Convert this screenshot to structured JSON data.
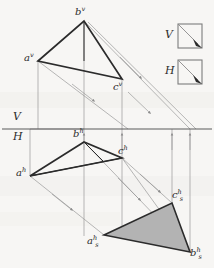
{
  "drawing": {
    "title": "Rabatment of a triangle in two-plane descriptive geometry projection",
    "type": "descriptive-geometry-projection",
    "background_color": "#f7f6f4",
    "ink_color": "#2b2b2b",
    "construction_color": "#9a9a9a",
    "fill_color": "#b3b3b3",
    "canvas": {
      "width": 214,
      "height": 268
    }
  },
  "ground_line": {
    "y": 129,
    "x_start": 2,
    "x_end": 212,
    "label_above": "V",
    "label_below": "H"
  },
  "vertical_projection": {
    "plane_label": "V",
    "points": [
      {
        "id": "a-v",
        "label": "a",
        "sup": "v",
        "x": 38,
        "y": 61,
        "label_x": 24,
        "label_y": 53
      },
      {
        "id": "b-v",
        "label": "b",
        "sup": "v",
        "x": 84,
        "y": 21,
        "label_x": 75,
        "label_y": 7
      },
      {
        "id": "c-v",
        "label": "c",
        "sup": "v",
        "x": 122,
        "y": 79,
        "label_x": 113,
        "label_y": 82
      }
    ]
  },
  "horizontal_projection": {
    "plane_label": "H",
    "points": [
      {
        "id": "a-h",
        "label": "a",
        "sup": "h",
        "x": 30,
        "y": 176,
        "label_x": 16,
        "label_y": 168
      },
      {
        "id": "b-h",
        "label": "b",
        "sup": "h",
        "x": 84,
        "y": 142,
        "label_x": 73,
        "label_y": 129
      },
      {
        "id": "c-h",
        "label": "c",
        "sup": "h",
        "x": 122,
        "y": 158,
        "label_x": 118,
        "label_y": 146
      }
    ]
  },
  "rabatted_triangle": {
    "shaded": true,
    "fill": "#b3b3b3",
    "points": [
      {
        "id": "as-h",
        "label": "a",
        "sup": "h",
        "sub": "s",
        "x": 104,
        "y": 235,
        "label_x": 87,
        "label_y": 236
      },
      {
        "id": "bs-h",
        "label": "b",
        "sup": "h",
        "sub": "s",
        "x": 190,
        "y": 252,
        "label_x": 190,
        "label_y": 248
      },
      {
        "id": "cs-h",
        "label": "c",
        "sup": "h",
        "sub": "s",
        "x": 172,
        "y": 203,
        "label_x": 172,
        "label_y": 190
      }
    ]
  },
  "legend": {
    "items": [
      {
        "id": "legend-v",
        "label": "V",
        "label_x": 165,
        "label_y": 30,
        "box_x": 178,
        "box_y": 24,
        "box_size": 24,
        "arrow": "diagonal-down-right"
      },
      {
        "id": "legend-h",
        "label": "H",
        "label_x": 165,
        "label_y": 66,
        "box_x": 178,
        "box_y": 60,
        "box_size": 24,
        "arrow": "diagonal-down-right"
      }
    ]
  },
  "projectors": {
    "vertical_lines_x": [
      30,
      84,
      122,
      172,
      190
    ],
    "arrow_direction": "up-to-ground-line"
  },
  "rotation_rays": {
    "direction": "down-right",
    "count": 4,
    "arrow_marker": "mid-arrow"
  }
}
